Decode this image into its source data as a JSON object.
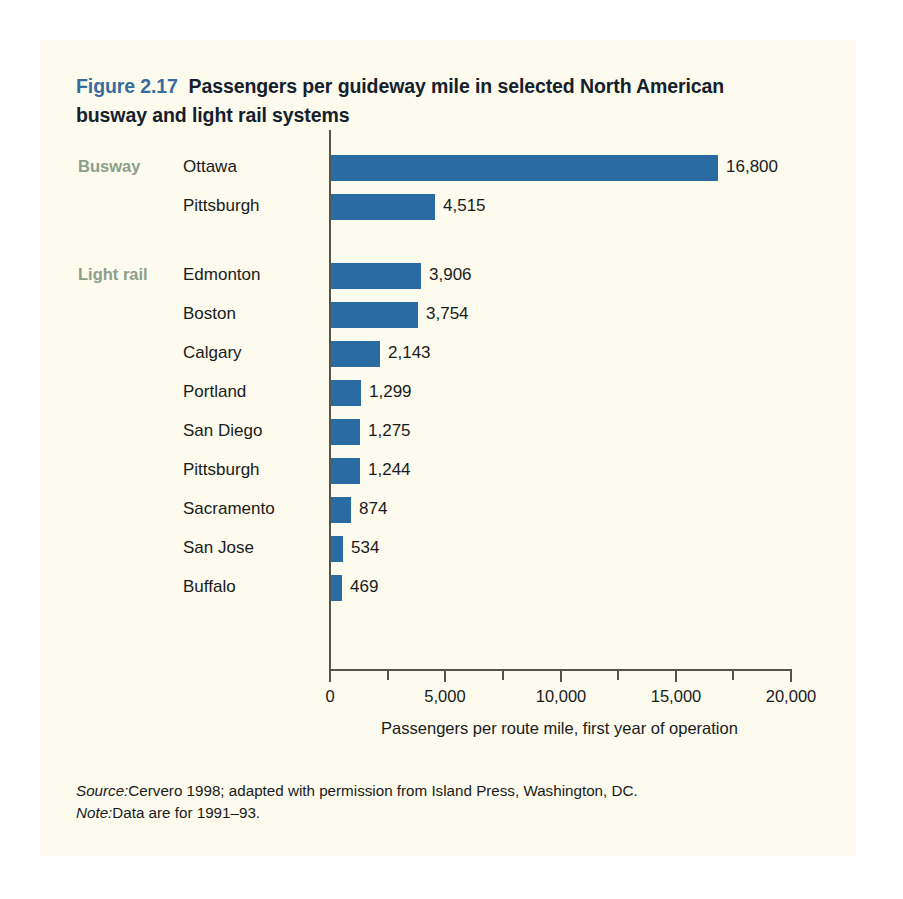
{
  "figure": {
    "number": "Figure 2.17",
    "title": "Passengers per guideway mile in selected North American busway and light rail systems"
  },
  "groups": [
    {
      "label": "Busway"
    },
    {
      "label": "Light rail"
    }
  ],
  "footnotes": {
    "source_lead": "Source:",
    "source_text": "Cervero 1998; adapted with permission from Island Press, Washington, DC.",
    "note_lead": "Note:",
    "note_text": "Data are for 1991–93."
  },
  "colors": {
    "bar": "#2a6ba4",
    "page": "#fcfbee",
    "figure_number": "#3a6b9e",
    "group_label": "#8d9f89",
    "axis": "#55544a",
    "text": "#1a1a1a"
  },
  "chart_data": {
    "type": "bar",
    "orientation": "horizontal",
    "title": "Passengers per guideway mile in selected North American busway and light rail systems",
    "xlabel": "Passengers per route mile, first year of operation",
    "ylabel": "",
    "xlim": [
      0,
      20000
    ],
    "xticks": [
      0,
      5000,
      10000,
      15000,
      20000
    ],
    "xticklabels": [
      "0",
      "5,000",
      "10,000",
      "15,000",
      "20,000"
    ],
    "minor_tick_step": 2500,
    "grid": false,
    "legend": false,
    "categories": [
      "Ottawa",
      "Pittsburgh",
      "Edmonton",
      "Boston",
      "Calgary",
      "Portland",
      "San Diego",
      "Pittsburgh",
      "Sacramento",
      "San Jose",
      "Buffalo"
    ],
    "values": [
      16800,
      4515,
      3906,
      3754,
      2143,
      1299,
      1275,
      1244,
      874,
      534,
      469
    ],
    "value_labels": [
      "16,800",
      "4,515",
      "3,906",
      "3,754",
      "2,143",
      "1,299",
      "1,275",
      "1,244",
      "874",
      "534",
      "469"
    ],
    "group_of": [
      "Busway",
      "Busway",
      "Light rail",
      "Light rail",
      "Light rail",
      "Light rail",
      "Light rail",
      "Light rail",
      "Light rail",
      "Light rail",
      "Light rail"
    ],
    "series": [
      {
        "name": "Passengers per route mile",
        "values": [
          16800,
          4515,
          3906,
          3754,
          2143,
          1299,
          1275,
          1244,
          874,
          534,
          469
        ]
      }
    ]
  }
}
